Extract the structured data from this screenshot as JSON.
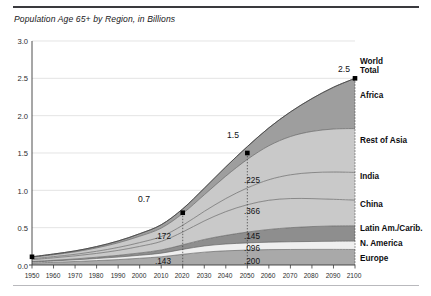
{
  "chart_data": {
    "type": "area",
    "title": "Population Age 65+ by Region, in Billions",
    "xlabel": "",
    "ylabel": "",
    "xlim": [
      1950,
      2100
    ],
    "ylim": [
      0.0,
      3.0
    ],
    "grid": true,
    "legend_position": "right-outside",
    "stacked": true,
    "x": [
      1950,
      1960,
      1970,
      1980,
      1990,
      2000,
      2010,
      2020,
      2030,
      2040,
      2050,
      2060,
      2070,
      2080,
      2090,
      2100
    ],
    "xtick_labels": [
      "1950",
      "1960",
      "1970",
      "1980",
      "1990",
      "2000",
      "2010",
      "2020",
      "2030",
      "2040",
      "2050",
      "2060",
      "2070",
      "2080",
      "2090",
      "2100"
    ],
    "ytick_labels": [
      "0.0",
      "0.5",
      "1.0",
      "1.5",
      "2.0",
      "2.5",
      "3.0"
    ],
    "ytick_values": [
      0.0,
      0.5,
      1.0,
      1.5,
      2.0,
      2.5,
      3.0
    ],
    "series": [
      {
        "name": "Europe",
        "color": "#a9a9a9",
        "values": [
          0.027,
          0.036,
          0.047,
          0.059,
          0.072,
          0.09,
          0.11,
          0.143,
          0.172,
          0.19,
          0.2,
          0.206,
          0.208,
          0.209,
          0.209,
          0.208
        ]
      },
      {
        "name": "N. America",
        "color": "#efefef",
        "values": [
          0.013,
          0.018,
          0.022,
          0.028,
          0.034,
          0.04,
          0.048,
          0.066,
          0.083,
          0.091,
          0.096,
          0.1,
          0.103,
          0.106,
          0.109,
          0.112
        ]
      },
      {
        "name": "Latin Am./Carib.",
        "color": "#8e8e8e",
        "values": [
          0.006,
          0.009,
          0.012,
          0.017,
          0.023,
          0.031,
          0.043,
          0.061,
          0.087,
          0.116,
          0.145,
          0.17,
          0.189,
          0.2,
          0.205,
          0.205
        ]
      },
      {
        "name": "China",
        "color": "#c9c9c9",
        "values": [
          0.025,
          0.033,
          0.041,
          0.051,
          0.067,
          0.088,
          0.115,
          0.172,
          0.248,
          0.318,
          0.366,
          0.391,
          0.39,
          0.374,
          0.357,
          0.344
        ]
      },
      {
        "name": "India",
        "color": "#c9c9c9",
        "values": [
          0.012,
          0.016,
          0.021,
          0.029,
          0.039,
          0.051,
          0.065,
          0.09,
          0.128,
          0.175,
          0.225,
          0.275,
          0.318,
          0.348,
          0.365,
          0.371
        ]
      },
      {
        "name": "Rest of Asia",
        "color": "#c9c9c9",
        "values": [
          0.019,
          0.025,
          0.033,
          0.045,
          0.062,
          0.085,
          0.113,
          0.158,
          0.222,
          0.3,
          0.382,
          0.455,
          0.512,
          0.552,
          0.576,
          0.588
        ]
      },
      {
        "name": "Africa",
        "color": "#9e9e9e",
        "values": [
          0.008,
          0.01,
          0.013,
          0.018,
          0.025,
          0.034,
          0.045,
          0.062,
          0.088,
          0.124,
          0.172,
          0.24,
          0.33,
          0.44,
          0.56,
          0.672
        ]
      }
    ],
    "annotations": [
      {
        "name": "total-2020",
        "x": 2020,
        "value": 0.7,
        "label": "0.7"
      },
      {
        "name": "total-2050",
        "x": 2050,
        "value": 1.5,
        "label": "1.5"
      },
      {
        "name": "total-2100",
        "x": 2100,
        "value": 2.5,
        "label": "2.5"
      }
    ],
    "value_labels": [
      {
        "x": 2020,
        "series": "Europe",
        "label": ".143"
      },
      {
        "x": 2020,
        "series": "China",
        "label": ".172"
      },
      {
        "x": 2050,
        "series": "Europe",
        "label": ".200"
      },
      {
        "x": 2050,
        "series": "N. America",
        "label": ".096"
      },
      {
        "x": 2050,
        "series": "Latin Am./Carib.",
        "label": ".145"
      },
      {
        "x": 2050,
        "series": "China",
        "label": ".366"
      },
      {
        "x": 2050,
        "series": "India",
        "label": ".225"
      }
    ],
    "region_labels": [
      {
        "name": "world-total",
        "text": "World\nTotal",
        "line1": "World",
        "line2": "Total"
      },
      {
        "name": "africa",
        "text": "Africa"
      },
      {
        "name": "rest-of-asia",
        "text": "Rest of Asia"
      },
      {
        "name": "india",
        "text": "India"
      },
      {
        "name": "china",
        "text": "China"
      },
      {
        "name": "latin-america-caribbean",
        "text": "Latin Am./Carib."
      },
      {
        "name": "north-america",
        "text": "N. America"
      },
      {
        "name": "europe",
        "text": "Europe"
      }
    ]
  },
  "axis": {
    "y_labels": [
      "3.0",
      "2.5",
      "2.0",
      "1.5",
      "1.0",
      "0.5",
      "0.0"
    ],
    "x_labels": [
      "1950",
      "1960",
      "1970",
      "1980",
      "1990",
      "2000",
      "2010",
      "2020",
      "2030",
      "2040",
      "2050",
      "2060",
      "2070",
      "2080",
      "2090",
      "2100"
    ]
  },
  "value_texts": {
    "t2020": "0.7",
    "t2050": "1.5",
    "t2100": "2.5",
    "europe_2020": ".143",
    "china_2020": ".172",
    "europe_2050": ".200",
    "namerica_2050": ".096",
    "latam_2050": ".145",
    "china_2050": ".366",
    "india_2050": ".225"
  },
  "regions": {
    "world_total_line1": "World",
    "world_total_line2": "Total",
    "africa": "Africa",
    "rest_of_asia": "Rest of Asia",
    "india": "India",
    "china": "China",
    "latin_america": "Latin Am./Carib.",
    "north_america": "N. America",
    "europe": "Europe"
  }
}
